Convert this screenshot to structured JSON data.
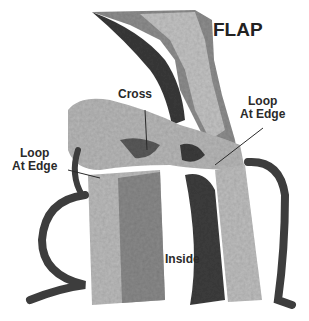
{
  "figure": {
    "labels": {
      "flap": "FLAP",
      "cross": "Cross",
      "loop_right_line1": "Loop",
      "loop_right_line2": "At Edge",
      "loop_left_line1": "Loop",
      "loop_left_line2": "At Edge",
      "inside": "Inside"
    },
    "colors": {
      "background": "#ffffff",
      "yarn_light": "#bdbdbd",
      "yarn_mid": "#8a8a8a",
      "yarn_dark": "#3c3c3c",
      "label_text": "#2a2a2a"
    }
  }
}
